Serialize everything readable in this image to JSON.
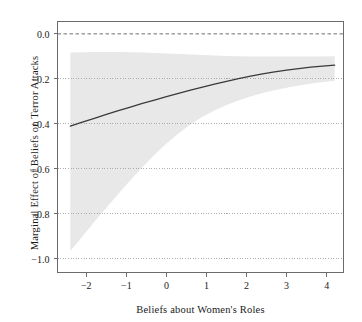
{
  "chart_data": {
    "type": "line",
    "title": "",
    "xlabel": "Beliefs about Women's Roles",
    "ylabel": "Marginal Effect of Beliefs on Terror Attacks",
    "xlim": [
      -2.72,
      4.42
    ],
    "ylim": [
      -1.06,
      0.055
    ],
    "xticks": [
      -2,
      -1,
      0,
      1,
      2,
      3,
      4
    ],
    "xticklabels": [
      "−2",
      "−1",
      "0",
      "1",
      "2",
      "3",
      "4"
    ],
    "yticks": [
      0.0,
      -0.2,
      -0.4,
      -0.6,
      -0.8,
      -1.0
    ],
    "yticklabels": [
      "0.0",
      "−0.2",
      "−0.4",
      "−0.6",
      "−0.8",
      "−1.0"
    ],
    "grid": "dotted-horizontal",
    "legend": "none",
    "zero_reference_line": {
      "y": 0.0,
      "style": "dashed"
    },
    "series": [
      {
        "name": "Marginal effect",
        "style": "solid-line",
        "color": "#3a3a3a",
        "x": [
          -2.4,
          -2.1,
          -1.8,
          -1.5,
          -1.2,
          -0.9,
          -0.6,
          -0.3,
          0.0,
          0.3,
          0.6,
          0.9,
          1.2,
          1.5,
          1.8,
          2.1,
          2.4,
          2.7,
          3.0,
          3.3,
          3.6,
          3.9,
          4.2
        ],
        "y": [
          -0.41,
          -0.392,
          -0.375,
          -0.358,
          -0.341,
          -0.325,
          -0.309,
          -0.294,
          -0.279,
          -0.264,
          -0.25,
          -0.236,
          -0.223,
          -0.211,
          -0.199,
          -0.188,
          -0.178,
          -0.169,
          -0.161,
          -0.154,
          -0.148,
          -0.143,
          -0.139
        ]
      },
      {
        "name": "95% confidence interval upper",
        "style": "band-edge",
        "x": [
          -2.4,
          -2.1,
          -1.8,
          -1.5,
          -1.2,
          -0.9,
          -0.6,
          -0.3,
          0.0,
          0.3,
          0.6,
          0.9,
          1.2,
          1.5,
          1.8,
          2.1,
          2.4,
          2.7,
          3.0,
          3.3,
          3.6,
          3.9,
          4.2
        ],
        "y": [
          -0.083,
          -0.082,
          -0.081,
          -0.081,
          -0.081,
          -0.082,
          -0.083,
          -0.085,
          -0.087,
          -0.089,
          -0.092,
          -0.094,
          -0.096,
          -0.098,
          -0.099,
          -0.1,
          -0.101,
          -0.101,
          -0.101,
          -0.101,
          -0.1,
          -0.1,
          -0.099
        ]
      },
      {
        "name": "95% confidence interval lower",
        "style": "band-edge",
        "x": [
          -2.4,
          -2.1,
          -1.8,
          -1.5,
          -1.2,
          -0.9,
          -0.6,
          -0.3,
          0.0,
          0.3,
          0.6,
          0.9,
          1.2,
          1.5,
          1.8,
          2.1,
          2.4,
          2.7,
          3.0,
          3.3,
          3.6,
          3.9,
          4.2
        ],
        "y": [
          -0.965,
          -0.9,
          -0.835,
          -0.772,
          -0.71,
          -0.65,
          -0.592,
          -0.537,
          -0.487,
          -0.442,
          -0.402,
          -0.368,
          -0.34,
          -0.316,
          -0.296,
          -0.278,
          -0.263,
          -0.25,
          -0.239,
          -0.229,
          -0.221,
          -0.214,
          -0.208
        ]
      }
    ],
    "band_color": "#e8e8e8",
    "line_color": "#3a3a3a",
    "axis_color": "#6b6b6b",
    "grid_color": "#9a9a9a",
    "text_color": "#1a1a1a",
    "background_color": "#ffffff"
  }
}
